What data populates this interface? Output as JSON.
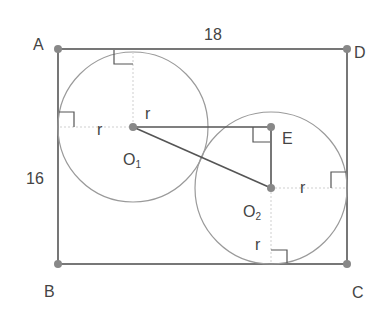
{
  "diagram": {
    "vertices": {
      "A": "A",
      "B": "B",
      "C": "C",
      "D": "D",
      "E": "E"
    },
    "centers": {
      "o1_base": "O",
      "o1_sub": "1",
      "o2_base": "O",
      "o2_sub": "2"
    },
    "dimensions": {
      "top": "18",
      "left": "16"
    },
    "radius_label": "r",
    "colors": {
      "line": "#555555",
      "circle": "#9a9a9a",
      "point": "#888888",
      "dashed": "#cfcfcf"
    }
  }
}
